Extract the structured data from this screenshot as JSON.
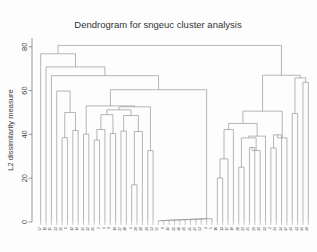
{
  "chart_data": {
    "type": "dendrogram",
    "title": "Dendrogram for sngeuc cluster analysis",
    "xlabel": "",
    "ylabel": "L2 dissimilarity measure",
    "ylim": [
      0,
      84
    ],
    "yticks": [
      0,
      20,
      40,
      60,
      80
    ],
    "ytick_labels": [
      "0",
      "20",
      "40",
      "60",
      "80"
    ],
    "grid": false,
    "legend": false,
    "n_leaves": 56,
    "leaf_labels": [
      "57",
      "11",
      "15",
      "23",
      "36",
      "1",
      "12",
      "14",
      "26",
      "32",
      "35",
      "7",
      "4",
      "9",
      "19",
      "27",
      "30",
      "6",
      "28",
      "38",
      "39",
      "52",
      "55",
      "8",
      "16",
      "21",
      "40",
      "41",
      "45",
      "47",
      "53",
      "3",
      "5",
      "10",
      "13",
      "17",
      "18",
      "20",
      "22",
      "25",
      "29",
      "31",
      "33",
      "2",
      "24",
      "34",
      "37",
      "42",
      "43",
      "46",
      "48",
      "49",
      "50",
      "51",
      "54",
      "56"
    ],
    "merges": [
      {
        "id": "m1",
        "left": "L5",
        "right": "L6",
        "height": 38.5
      },
      {
        "id": "m2",
        "left": "L7",
        "right": "L8",
        "height": 41.8
      },
      {
        "id": "m3",
        "left": "m1",
        "right": "m2",
        "height": 50.0
      },
      {
        "id": "m4",
        "left": "L4",
        "right": "m3",
        "height": 59.8
      },
      {
        "id": "m5",
        "left": "L9",
        "right": "L10",
        "height": 40.1
      },
      {
        "id": "m6",
        "left": "L11",
        "right": "L12",
        "height": 37.4
      },
      {
        "id": "m7",
        "left": "m6",
        "right": "L13",
        "height": 42.2
      },
      {
        "id": "m8",
        "left": "L14",
        "right": "L15",
        "height": 40.4
      },
      {
        "id": "m9",
        "left": "m7",
        "right": "m8",
        "height": 49.0
      },
      {
        "id": "m10",
        "left": "L16",
        "right": "L17",
        "height": 41.5
      },
      {
        "id": "m11",
        "left": "L18",
        "right": "L19",
        "height": 17.0
      },
      {
        "id": "m12",
        "left": "m11",
        "right": "L20",
        "height": 41.3
      },
      {
        "id": "m13",
        "left": "m10",
        "right": "m12",
        "height": 48.6
      },
      {
        "id": "m14",
        "left": "m9",
        "right": "m13",
        "height": 51.2
      },
      {
        "id": "m15",
        "left": "L21",
        "right": "L22",
        "height": 32.6
      },
      {
        "id": "m16",
        "left": "m14",
        "right": "m15",
        "height": 52.6
      },
      {
        "id": "m17",
        "left": "m5",
        "right": "m16",
        "height": 53.0
      },
      {
        "id": "m18",
        "left": "L23",
        "right": "L24",
        "height": 0.6
      },
      {
        "id": "m19",
        "left": "m18",
        "right": "L25",
        "height": 0.7
      },
      {
        "id": "m20",
        "left": "m19",
        "right": "L26",
        "height": 0.8
      },
      {
        "id": "m21",
        "left": "m20",
        "right": "L27",
        "height": 0.9
      },
      {
        "id": "m22",
        "left": "m21",
        "right": "L28",
        "height": 1.0
      },
      {
        "id": "m23",
        "left": "m22",
        "right": "L29",
        "height": 1.1
      },
      {
        "id": "m24",
        "left": "m23",
        "right": "L30",
        "height": 1.2
      },
      {
        "id": "m25",
        "left": "m24",
        "right": "L31",
        "height": 1.3
      },
      {
        "id": "m26",
        "left": "m25",
        "right": "L32",
        "height": 1.4
      },
      {
        "id": "m27",
        "left": "m26",
        "right": "L33",
        "height": 1.5
      },
      {
        "id": "m28",
        "left": "m17",
        "right": "m27",
        "height": 60.4
      },
      {
        "id": "m29",
        "left": "L3",
        "right": "m28",
        "height": 66.8
      },
      {
        "id": "m30",
        "left": "L2",
        "right": "m29",
        "height": 70.8
      },
      {
        "id": "m31",
        "left": "L1",
        "right": "m30",
        "height": 76.8
      },
      {
        "id": "m32",
        "left": "L34",
        "right": "L35",
        "height": 20.1
      },
      {
        "id": "m33",
        "left": "m32",
        "right": "L36",
        "height": 28.8
      },
      {
        "id": "m34",
        "left": "m33",
        "right": "L37",
        "height": 42.2
      },
      {
        "id": "m35",
        "left": "L38",
        "right": "L39",
        "height": 25.0
      },
      {
        "id": "m36",
        "left": "L40",
        "right": "L41",
        "height": 34.0
      },
      {
        "id": "m37",
        "left": "m36",
        "right": "L42",
        "height": 32.6
      },
      {
        "id": "m38",
        "left": "m35",
        "right": "m37",
        "height": 38.4
      },
      {
        "id": "m39",
        "left": "m38",
        "right": "L43",
        "height": 39.2
      },
      {
        "id": "m40",
        "left": "m34",
        "right": "m39",
        "height": 45.0
      },
      {
        "id": "m41",
        "left": "L44",
        "right": "L45",
        "height": 33.8
      },
      {
        "id": "m42",
        "left": "m41",
        "right": "L46",
        "height": 39.8
      },
      {
        "id": "m43",
        "left": "m42",
        "right": "L47",
        "height": 38.4
      },
      {
        "id": "m44",
        "left": "m40",
        "right": "m43",
        "height": 50.6
      },
      {
        "id": "m45",
        "left": "L48",
        "right": "L49",
        "height": 49.5
      },
      {
        "id": "m46",
        "left": "L50",
        "right": "L51",
        "height": 63.8
      },
      {
        "id": "m47",
        "left": "m45",
        "right": "m46",
        "height": 65.8
      },
      {
        "id": "m48",
        "left": "m44",
        "right": "m47",
        "height": 67.0
      },
      {
        "id": "m49",
        "left": "m31",
        "right": "m48",
        "height": 80.6
      }
    ],
    "leaf_order": [
      "L1",
      "L2",
      "L3",
      "L4",
      "L5",
      "L6",
      "L7",
      "L8",
      "L9",
      "L10",
      "L11",
      "L12",
      "L13",
      "L14",
      "L15",
      "L16",
      "L17",
      "L18",
      "L19",
      "L20",
      "L21",
      "L22",
      "L23",
      "L24",
      "L25",
      "L26",
      "L27",
      "L28",
      "L29",
      "L30",
      "L31",
      "L32",
      "L33",
      "L34",
      "L35",
      "L36",
      "L37",
      "L38",
      "L39",
      "L40",
      "L41",
      "L42",
      "L43",
      "L44",
      "L45",
      "L46",
      "L47",
      "L48",
      "L49",
      "L50",
      "L51"
    ],
    "root": "m49",
    "colors": {
      "line": "#8a8a8a",
      "axis": "#6f6f6f",
      "text": "#3a3a3a",
      "background": "#fdfdfd"
    },
    "geometry": {
      "plot_left": 38,
      "plot_right": 311,
      "plot_top": 38,
      "baseline_y": 222,
      "y_value_top": 84
    }
  }
}
